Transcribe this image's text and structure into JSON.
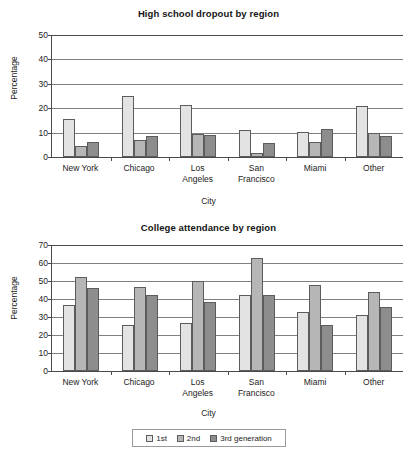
{
  "chart_data": [
    {
      "type": "bar",
      "title": "High school dropout by region",
      "xlabel": "City",
      "ylabel": "Percentage",
      "ylim": [
        0,
        50
      ],
      "yticks": [
        0,
        10,
        20,
        30,
        40,
        50
      ],
      "grid": true,
      "legend_position": "bottom",
      "categories": [
        "New York",
        "Chicago",
        "Los Angeles",
        "San Francisco",
        "Miami",
        "Other"
      ],
      "category_lines": [
        [
          "New York"
        ],
        [
          "Chicago"
        ],
        [
          "Los",
          "Angeles"
        ],
        [
          "San",
          "Francisco"
        ],
        [
          "Miami"
        ],
        [
          "Other"
        ]
      ],
      "series": [
        {
          "name": "1st",
          "color": "#e3e3e3",
          "values": [
            15.5,
            25.0,
            21.5,
            11.0,
            10.4,
            21.0
          ]
        },
        {
          "name": "2nd",
          "color": "#b6b6b6",
          "values": [
            4.7,
            6.8,
            9.4,
            1.7,
            6.1,
            10.0
          ]
        },
        {
          "name": "3rd generation",
          "color": "#8d8d8d",
          "values": [
            6.2,
            8.5,
            8.9,
            5.8,
            11.3,
            8.8
          ]
        }
      ]
    },
    {
      "type": "bar",
      "title": "College attendance by region",
      "xlabel": "City",
      "ylabel": "Percentage",
      "ylim": [
        0,
        70
      ],
      "yticks": [
        0,
        10,
        20,
        30,
        40,
        50,
        60,
        70
      ],
      "grid": true,
      "legend_position": "bottom",
      "categories": [
        "New York",
        "Chicago",
        "Los Angeles",
        "San Francisco",
        "Miami",
        "Other"
      ],
      "category_lines": [
        [
          "New York"
        ],
        [
          "Chicago"
        ],
        [
          "Los",
          "Angeles"
        ],
        [
          "San",
          "Francisco"
        ],
        [
          "Miami"
        ],
        [
          "Other"
        ]
      ],
      "series": [
        {
          "name": "1st",
          "color": "#e3e3e3",
          "values": [
            36.5,
            25.5,
            26.5,
            42.5,
            33.0,
            31.0
          ]
        },
        {
          "name": "2nd",
          "color": "#b6b6b6",
          "values": [
            52.0,
            46.5,
            50.0,
            63.0,
            48.0,
            44.0
          ]
        },
        {
          "name": "3rd generation",
          "color": "#8d8d8d",
          "values": [
            46.0,
            42.5,
            38.5,
            42.5,
            25.5,
            35.5
          ]
        }
      ]
    }
  ],
  "legend": {
    "items": [
      {
        "label": "1st",
        "color": "#e3e3e3"
      },
      {
        "label": "2nd",
        "color": "#b6b6b6"
      },
      {
        "label": "3rd generation",
        "color": "#8d8d8d"
      }
    ]
  }
}
